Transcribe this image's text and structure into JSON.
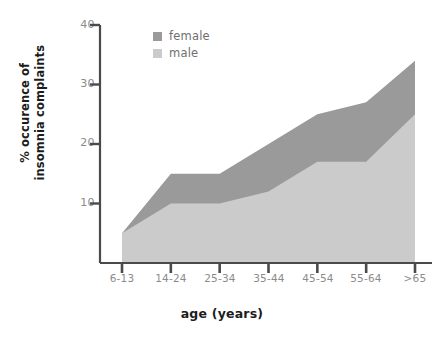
{
  "chart_data": {
    "type": "area",
    "title": "",
    "subtitle": "",
    "xlabel": "age (years)",
    "ylabel_line1": "% occurence of",
    "ylabel_line2": "insomnia complaints",
    "categories": [
      "6-13",
      "14-24",
      "25-34",
      "35-44",
      "45-54",
      "55-64",
      ">65"
    ],
    "stacked": true,
    "series": [
      {
        "name": "female",
        "color": "#9a9a9a",
        "values": [
          5,
          15,
          15,
          20,
          25,
          27,
          34
        ]
      },
      {
        "name": "male",
        "color": "#cbcbcb",
        "values": [
          5,
          10,
          10,
          12,
          17,
          17,
          25
        ]
      }
    ],
    "ylim": [
      0,
      40
    ],
    "yticks": [
      10,
      20,
      30,
      40
    ],
    "ytick_labels": [
      "10",
      "20",
      "30",
      "40"
    ],
    "grid": false,
    "legend": {
      "position": "top-left-inside",
      "entries": [
        "female",
        "male"
      ]
    },
    "axis_color": "#4a4a4a",
    "tick_label_color": "#8b8b8b",
    "title_color": "#1c1c1c",
    "background": "#ffffff"
  },
  "legend": {
    "items": [
      {
        "label": "female",
        "color": "#9a9a9a"
      },
      {
        "label": "male",
        "color": "#cbcbcb"
      }
    ]
  },
  "axes": {
    "y_title_line1": "% occurence of",
    "y_title_line2": "insomnia complaints",
    "x_title": "age (years)",
    "y_tick_labels": [
      "40",
      "30",
      "20",
      "10"
    ],
    "x_tick_labels": [
      "6-13",
      "14-24",
      "25-34",
      "35-44",
      "45-54",
      "55-64",
      ">65"
    ]
  }
}
